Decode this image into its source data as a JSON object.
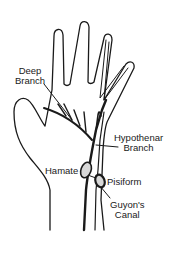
{
  "diagram": {
    "labels": {
      "deep_branch_1": "Deep",
      "deep_branch_2": "Branch",
      "hypothenar_1": "Hypothenar",
      "hypothenar_2": "Branch",
      "hamate": "Hamate",
      "pisiform": "Pisiform",
      "guyons_1": "Guyon's",
      "guyons_2": "Canal"
    },
    "colors": {
      "line": "#1a1a1a",
      "bone_fill": "#d8d8d8",
      "background": "#ffffff"
    }
  }
}
